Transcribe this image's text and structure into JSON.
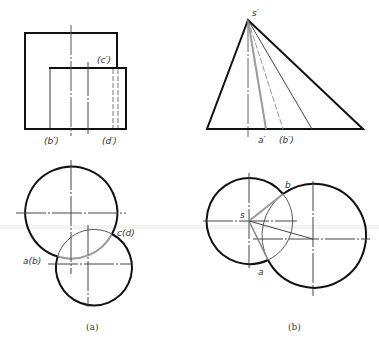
{
  "figure": {
    "panels": [
      {
        "id": "a",
        "caption": "(a)",
        "front_view_labels": {
          "c_prime": "(c′)",
          "b_prime": "(b′)",
          "d_prime": "(d′)"
        },
        "top_view_labels": {
          "ab": "a(b)",
          "cd": "c(d)"
        }
      },
      {
        "id": "b",
        "caption": "(b)",
        "front_view_labels": {
          "s_prime": "s′",
          "a_prime": "a′",
          "b_prime": "(b′)"
        },
        "top_view_labels": {
          "s": "s",
          "a": "a",
          "b": "b"
        }
      }
    ]
  },
  "colors": {
    "outline": "#111111",
    "centerline": "#555555",
    "highlight": "#9a9a9a",
    "thin": "#444444"
  }
}
